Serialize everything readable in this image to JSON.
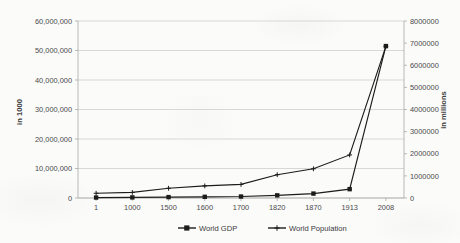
{
  "chart_data": {
    "type": "line",
    "title": "",
    "subtitle": "",
    "xlabel": "",
    "ylabel": "in 1000",
    "y2label": "in millions",
    "grid": true,
    "legend_position": "bottom",
    "categories": [
      "1",
      "1000",
      "1500",
      "1600",
      "1700",
      "1820",
      "1870",
      "1913",
      "2008"
    ],
    "yticks": [
      "0",
      "10,000,000",
      "20,000,000",
      "30,000,000",
      "40,000,000",
      "50,000,000",
      "60,000,000"
    ],
    "ytick_values": [
      0,
      10000000,
      20000000,
      30000000,
      40000000,
      50000000,
      60000000
    ],
    "ylim": [
      0,
      60000000
    ],
    "y2ticks": [
      "0",
      "1000000",
      "2000000",
      "3000000",
      "4000000",
      "5000000",
      "6000000",
      "7000000",
      "8000000"
    ],
    "y2tick_values": [
      0,
      1000000,
      2000000,
      3000000,
      4000000,
      5000000,
      6000000,
      7000000,
      8000000
    ],
    "y2lim": [
      0,
      8000000
    ],
    "series": [
      {
        "name": "World GDP",
        "axis": "left",
        "marker": "square",
        "color": "#1c1c1c",
        "values": [
          150000,
          200000,
          300000,
          400000,
          500000,
          900000,
          1500000,
          3000000,
          51500000
        ]
      },
      {
        "name": "World Population",
        "axis": "left",
        "marker": "plus",
        "color": "#1c1c1c",
        "values": [
          1600000,
          1900000,
          3300000,
          4100000,
          4600000,
          7900000,
          9900000,
          14600000,
          51400000
        ]
      }
    ],
    "series_population_right_axis_values": [
      213,
      253,
      440,
      547,
      613,
      1053,
      1320,
      1947,
      6853
    ]
  },
  "legend": {
    "items": [
      {
        "label": "World GDP",
        "marker": "square"
      },
      {
        "label": "World Population",
        "marker": "plus"
      }
    ]
  },
  "axes": {
    "left_title": "in 1000",
    "right_title": "in millions"
  }
}
